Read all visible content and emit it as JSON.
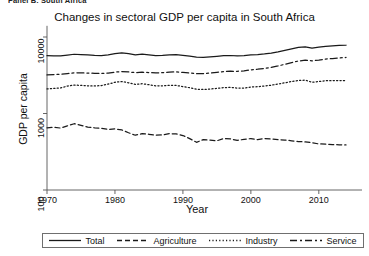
{
  "page": {
    "clipped_caption": "Panel B: South Africa"
  },
  "chart_data": {
    "type": "line",
    "title": "Changes in sectoral GDP per capita in South Africa",
    "xlabel": "Year",
    "ylabel": "GDP per capita",
    "yscale": "log",
    "ylim": [
      100,
      14000
    ],
    "ytick_labels": [
      "10000",
      "1000",
      "100"
    ],
    "ytick_values": [
      10000,
      1000,
      100
    ],
    "xlim": [
      1968,
      2015
    ],
    "xtick_labels": [
      "1970",
      "1980",
      "1990",
      "2000",
      "2010"
    ],
    "xtick_values": [
      1970,
      1980,
      1990,
      2000,
      2010
    ],
    "grid": false,
    "legend_position": "bottom",
    "x": [
      1970,
      1971,
      1972,
      1973,
      1974,
      1975,
      1976,
      1977,
      1978,
      1979,
      1980,
      1981,
      1982,
      1983,
      1984,
      1985,
      1986,
      1987,
      1988,
      1989,
      1990,
      1991,
      1992,
      1993,
      1994,
      1995,
      1996,
      1997,
      1998,
      1999,
      2000,
      2001,
      2002,
      2003,
      2004,
      2005,
      2006,
      2007,
      2008,
      2009,
      2010,
      2011,
      2012,
      2013,
      2014
    ],
    "series": [
      {
        "name": "Total",
        "style": "solid",
        "color": "#1a1a1a",
        "values": [
          5700,
          5680,
          5650,
          5800,
          5950,
          5900,
          5820,
          5750,
          5720,
          5820,
          6050,
          6200,
          6050,
          5850,
          5980,
          5850,
          5720,
          5760,
          5860,
          5870,
          5760,
          5620,
          5450,
          5430,
          5510,
          5600,
          5700,
          5730,
          5680,
          5700,
          5850,
          5900,
          6000,
          6150,
          6400,
          6700,
          7000,
          7300,
          7450,
          7150,
          7350,
          7550,
          7650,
          7750,
          7800
        ]
      },
      {
        "name": "Agriculture",
        "style": "dashed",
        "color": "#1a1a1a",
        "values": [
          650,
          660,
          645,
          690,
          735,
          700,
          665,
          650,
          640,
          620,
          630,
          610,
          560,
          520,
          545,
          535,
          520,
          525,
          545,
          540,
          515,
          470,
          420,
          455,
          450,
          440,
          470,
          465,
          445,
          460,
          470,
          455,
          470,
          465,
          455,
          450,
          440,
          430,
          425,
          415,
          400,
          398,
          392,
          390,
          388
        ]
      },
      {
        "name": "Industry",
        "style": "dotted",
        "color": "#1a1a1a",
        "values": [
          2100,
          2130,
          2160,
          2280,
          2350,
          2330,
          2300,
          2290,
          2320,
          2420,
          2560,
          2620,
          2520,
          2400,
          2450,
          2380,
          2300,
          2300,
          2340,
          2330,
          2250,
          2170,
          2080,
          2060,
          2090,
          2130,
          2180,
          2190,
          2150,
          2150,
          2220,
          2240,
          2290,
          2340,
          2430,
          2520,
          2620,
          2700,
          2730,
          2560,
          2620,
          2680,
          2690,
          2700,
          2700
        ]
      },
      {
        "name": "Service",
        "style": "dashdot",
        "color": "#1a1a1a",
        "values": [
          3200,
          3230,
          3250,
          3320,
          3400,
          3400,
          3380,
          3350,
          3340,
          3380,
          3470,
          3540,
          3490,
          3420,
          3470,
          3430,
          3390,
          3420,
          3480,
          3500,
          3450,
          3390,
          3320,
          3320,
          3380,
          3450,
          3530,
          3570,
          3560,
          3600,
          3720,
          3790,
          3880,
          4000,
          4180,
          4400,
          4620,
          4850,
          4980,
          4880,
          5000,
          5150,
          5230,
          5320,
          5400
        ]
      }
    ]
  },
  "legend": {
    "entries": [
      {
        "label": "Total",
        "style": "solid"
      },
      {
        "label": "Agriculture",
        "style": "dashed"
      },
      {
        "label": "Industry",
        "style": "dotted"
      },
      {
        "label": "Service",
        "style": "dashdot"
      }
    ]
  }
}
